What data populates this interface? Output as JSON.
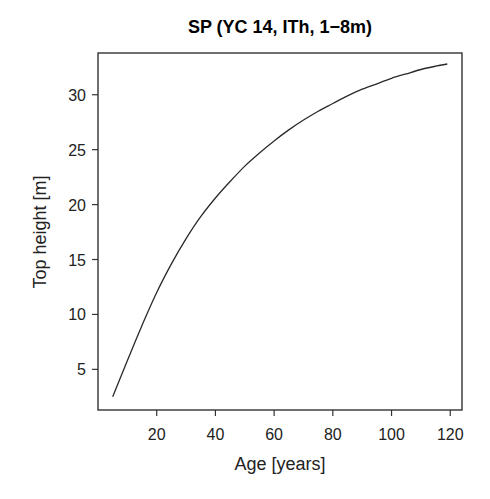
{
  "chart_data": {
    "type": "line",
    "title": "SP (YC 14, ITh, 1−8m)",
    "xlabel": "Age [years]",
    "ylabel": "Top height [m]",
    "xlim": [
      0,
      124
    ],
    "ylim": [
      1.3,
      33.8
    ],
    "xticks": [
      20,
      40,
      60,
      80,
      100,
      120
    ],
    "yticks": [
      5,
      10,
      15,
      20,
      25,
      30
    ],
    "grid": false,
    "legend": null,
    "series": [
      {
        "name": "Top height",
        "color": "#2a2a2a",
        "x": [
          5,
          10,
          15,
          20,
          25,
          30,
          35,
          40,
          45,
          50,
          55,
          60,
          65,
          70,
          75,
          80,
          85,
          90,
          95,
          100,
          105,
          110,
          115,
          119
        ],
        "y": [
          2.5,
          5.8,
          9.0,
          12.0,
          14.6,
          16.9,
          18.9,
          20.6,
          22.1,
          23.5,
          24.7,
          25.8,
          26.8,
          27.7,
          28.5,
          29.2,
          29.9,
          30.5,
          31.0,
          31.5,
          31.9,
          32.3,
          32.6,
          32.8
        ]
      }
    ]
  }
}
